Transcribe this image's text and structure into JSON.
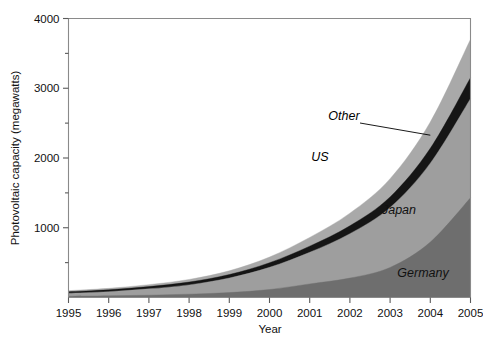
{
  "chart_data": {
    "type": "area",
    "stacked": true,
    "title": "",
    "xlabel": "Year",
    "ylabel": "Photovoltaic capacity (megawatts)",
    "x": [
      1995,
      1996,
      1997,
      1998,
      1999,
      2000,
      2001,
      2002,
      2003,
      2004,
      2005
    ],
    "xtick_labels": [
      "1995",
      "1996",
      "1997",
      "1998",
      "1999",
      "2000",
      "2001",
      "2002",
      "2003",
      "2004",
      "2005"
    ],
    "ytick_labels": [
      "1000",
      "2000",
      "3000",
      "4000"
    ],
    "ytick_values": [
      1000,
      2000,
      3000,
      4000
    ],
    "yminor_values": [
      500,
      1500,
      2500,
      3500
    ],
    "xlim": [
      1995,
      2005
    ],
    "ylim": [
      0,
      4000
    ],
    "grid": false,
    "legend_position": "inline-annotations",
    "series": [
      {
        "name": "Germany",
        "color": "#6e6e6e",
        "values": [
          18,
          24,
          33,
          48,
          70,
          114,
          195,
          278,
          431,
          794,
          1429
        ]
      },
      {
        "name": "Japan",
        "color": "#9e9e9e",
        "values": [
          43,
          60,
          91,
          133,
          209,
          318,
          453,
          637,
          860,
          1132,
          1422
        ]
      },
      {
        "name": "US",
        "color": "#151515",
        "values": [
          21,
          26,
          32,
          40,
          50,
          66,
          88,
          113,
          151,
          213,
          300
        ]
      },
      {
        "name": "Other",
        "color": "#a9a9a9",
        "values": [
          16,
          21,
          28,
          38,
          54,
          82,
          126,
          181,
          262,
          377,
          551
        ]
      }
    ],
    "totals": [
      98,
      131,
      184,
      259,
      383,
      580,
      862,
      1209,
      1704,
      2516,
      3702
    ],
    "annotations": [
      {
        "text": "Other",
        "target_series": "Other",
        "has_leader_line": true
      },
      {
        "text": "US",
        "target_series": "US",
        "has_leader_line": true
      },
      {
        "text": "Japan",
        "target_series": "Japan",
        "has_leader_line": false
      },
      {
        "text": "Germany",
        "target_series": "Germany",
        "has_leader_line": false
      }
    ]
  },
  "axes": {
    "y_title": "Photovoltaic capacity (megawatts)",
    "x_title": "Year"
  }
}
